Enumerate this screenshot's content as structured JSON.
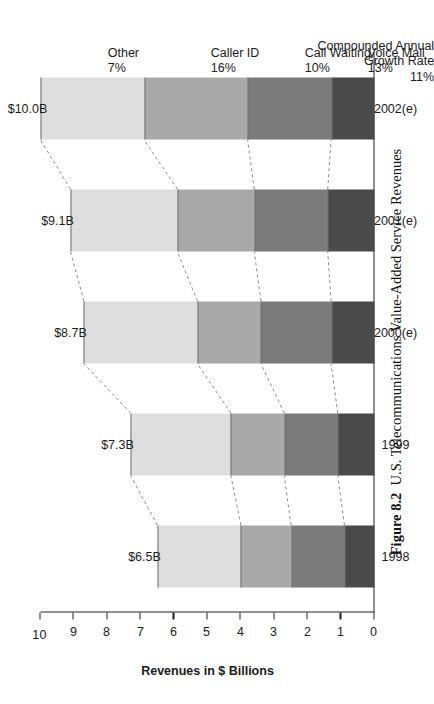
{
  "caption": {
    "figure_number": "Figure 8.2",
    "text": "U.S. Telecommunications Value-Added Service Revenues"
  },
  "annotation_header": {
    "line1": "Compounded Annual",
    "line2": "Growth Rate",
    "overall_rate": "11%"
  },
  "axis": {
    "value_title": "Revenues in $ Billions",
    "value_ticks": [
      "10",
      "9",
      "8",
      "7",
      "6",
      "5",
      "4",
      "3",
      "2",
      "1",
      "0"
    ]
  },
  "bar_totals": [
    "$6.5B",
    "$7.3B",
    "$8.7B",
    "$9.1B",
    "$10.0B"
  ],
  "series_labels": [
    {
      "name": "Voice Mail",
      "rate": "13%"
    },
    {
      "name": "Call Waiting",
      "rate": "10%"
    },
    {
      "name": "Caller ID",
      "rate": "16%"
    },
    {
      "name": "Other",
      "rate": "7%"
    }
  ],
  "colors": {
    "voice_mail": "#4a4a4a",
    "call_waiting": "#7b7b7b",
    "caller_id": "#a9a9a9",
    "other": "#dedede",
    "axis": "#222222",
    "leader": "#8a8a8a"
  },
  "chart_data": {
    "type": "bar",
    "title": "U.S. Telecommunications Value-Added Service Revenues",
    "subtitle": "",
    "xlabel": "",
    "ylabel": "Revenues in $ Billions",
    "ylim": [
      0,
      10
    ],
    "yticks": [
      0,
      1,
      2,
      3,
      4,
      5,
      6,
      7,
      8,
      9,
      10
    ],
    "grid": false,
    "stacked": true,
    "orientation": "vertical",
    "legend_position": "callout-annotations-right",
    "categories": [
      "1998",
      "1999",
      "2000(e)",
      "2001(e)",
      "2002(e)"
    ],
    "series": [
      {
        "name": "Voice Mail",
        "cagr": "13%",
        "color": "#4a4a4a",
        "values": [
          0.9,
          1.1,
          1.3,
          1.4,
          1.3
        ]
      },
      {
        "name": "Call Waiting",
        "cagr": "10%",
        "color": "#7b7b7b",
        "values": [
          1.6,
          1.6,
          2.1,
          2.2,
          2.5
        ]
      },
      {
        "name": "Caller ID",
        "cagr": "16%",
        "color": "#a9a9a9",
        "values": [
          1.5,
          1.6,
          1.9,
          2.3,
          3.1
        ]
      },
      {
        "name": "Other",
        "cagr": "7%",
        "color": "#dedede",
        "values": [
          2.5,
          3.0,
          3.4,
          3.2,
          3.1
        ]
      }
    ],
    "totals": [
      6.5,
      7.3,
      8.7,
      9.1,
      10.0
    ],
    "total_labels": [
      "$6.5B",
      "$7.3B",
      "$8.7B",
      "$9.1B",
      "$10.0B"
    ],
    "overall_cagr": "11%",
    "annotations": [
      "Compounded Annual Growth Rate"
    ]
  }
}
